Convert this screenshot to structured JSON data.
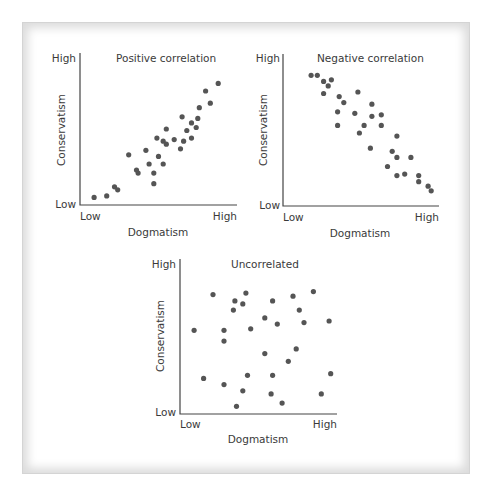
{
  "chart_data": [
    {
      "type": "scatter",
      "title": "Positive correlation",
      "xlabel": "Dogmatism",
      "ylabel": "Conservatism",
      "x_ticks": [
        "Low",
        "High"
      ],
      "y_ticks": [
        "Low",
        "High"
      ],
      "xlim": [
        0,
        100
      ],
      "ylim": [
        0,
        100
      ],
      "grid": false,
      "points": [
        [
          9,
          5
        ],
        [
          17,
          6
        ],
        [
          22,
          12
        ],
        [
          24,
          10
        ],
        [
          31,
          33
        ],
        [
          36,
          23
        ],
        [
          37,
          21
        ],
        [
          42,
          36
        ],
        [
          44,
          27
        ],
        [
          47,
          14
        ],
        [
          47,
          21
        ],
        [
          49,
          44
        ],
        [
          50,
          32
        ],
        [
          53,
          42
        ],
        [
          55,
          40
        ],
        [
          53,
          27
        ],
        [
          55,
          50
        ],
        [
          60,
          43
        ],
        [
          64,
          37
        ],
        [
          65,
          58
        ],
        [
          66,
          42
        ],
        [
          68,
          49
        ],
        [
          71,
          54
        ],
        [
          71,
          44
        ],
        [
          74,
          51
        ],
        [
          75,
          57
        ],
        [
          76,
          64
        ],
        [
          80,
          75
        ],
        [
          83,
          67
        ],
        [
          88,
          80
        ]
      ]
    },
    {
      "type": "scatter",
      "title": "Negative correlation",
      "xlabel": "Dogmatism",
      "ylabel": "Conservatism",
      "x_ticks": [
        "Low",
        "High"
      ],
      "y_ticks": [
        "Low",
        "High"
      ],
      "xlim": [
        0,
        100
      ],
      "ylim": [
        0,
        100
      ],
      "grid": false,
      "points": [
        [
          18,
          86
        ],
        [
          22,
          86
        ],
        [
          26,
          82
        ],
        [
          31,
          83
        ],
        [
          29,
          79
        ],
        [
          26,
          74
        ],
        [
          48,
          75
        ],
        [
          36,
          72
        ],
        [
          39,
          68
        ],
        [
          35,
          62
        ],
        [
          46,
          61
        ],
        [
          57,
          67
        ],
        [
          57,
          59
        ],
        [
          63,
          60
        ],
        [
          35,
          53
        ],
        [
          52,
          53
        ],
        [
          63,
          53
        ],
        [
          49,
          48
        ],
        [
          73,
          46
        ],
        [
          56,
          38
        ],
        [
          70,
          36
        ],
        [
          73,
          32
        ],
        [
          82,
          32
        ],
        [
          67,
          26
        ],
        [
          73,
          20
        ],
        [
          78,
          21
        ],
        [
          87,
          20
        ],
        [
          87,
          16
        ],
        [
          93,
          13
        ],
        [
          95,
          10
        ]
      ]
    },
    {
      "type": "scatter",
      "title": "Uncorrelated",
      "xlabel": "Dogmatism",
      "ylabel": "Conservatism",
      "x_ticks": [
        "Low",
        "High"
      ],
      "y_ticks": [
        "Low",
        "High"
      ],
      "xlim": [
        0,
        100
      ],
      "ylim": [
        0,
        100
      ],
      "grid": false,
      "points": [
        [
          21,
          77
        ],
        [
          42,
          78
        ],
        [
          35,
          73
        ],
        [
          40,
          71
        ],
        [
          34,
          67
        ],
        [
          59,
          73
        ],
        [
          72,
          76
        ],
        [
          85,
          79
        ],
        [
          76,
          67
        ],
        [
          54,
          62
        ],
        [
          62,
          58
        ],
        [
          79,
          59
        ],
        [
          95,
          60
        ],
        [
          9,
          54
        ],
        [
          28,
          54
        ],
        [
          45,
          55
        ],
        [
          28,
          47
        ],
        [
          54,
          39
        ],
        [
          74,
          42
        ],
        [
          69,
          34
        ],
        [
          15,
          23
        ],
        [
          28,
          19
        ],
        [
          43,
          25
        ],
        [
          59,
          25
        ],
        [
          96,
          26
        ],
        [
          40,
          15
        ],
        [
          58,
          13
        ],
        [
          90,
          13
        ],
        [
          65,
          7
        ],
        [
          36,
          5
        ]
      ]
    }
  ],
  "labels": {
    "high": "High",
    "low": "Low",
    "xlabel": "Dogmatism",
    "ylabel": "Conservatism",
    "titles": [
      "Positive correlation",
      "Negative correlation",
      "Uncorrelated"
    ]
  }
}
